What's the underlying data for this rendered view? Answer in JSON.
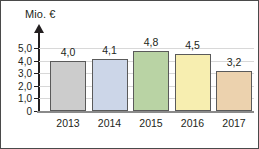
{
  "chart_data": {
    "type": "bar",
    "title": "",
    "subtitle": "",
    "xlabel": "",
    "ylabel": "Mio. €",
    "categories": [
      "2013",
      "2014",
      "2015",
      "2016",
      "2017"
    ],
    "values": [
      4.0,
      4.1,
      4.8,
      4.5,
      3.2
    ],
    "value_labels": [
      "4,0",
      "4,1",
      "4,8",
      "4,5",
      "3,2"
    ],
    "ylim": [
      0,
      5.6
    ],
    "ytick_values": [
      0,
      1.0,
      2.0,
      3.0,
      4.0,
      5.0
    ],
    "ytick_labels": [
      "0",
      "1,0",
      "2,0",
      "3,0",
      "4,0",
      "5,0"
    ],
    "grid": true,
    "grid_axis": "y",
    "legend": false,
    "legend_position": "none",
    "decimal_separator": ",",
    "bar_colors": [
      "#cccccc",
      "#ccd6e8",
      "#b9d3a4",
      "#f7eeb0",
      "#ecd2ae"
    ],
    "bar_border_color": "#5a5a5a",
    "axis_color": "#231f20",
    "gridline_color": "#d8d8d8",
    "baseline_color": "#8a8a8a",
    "frame_color": "#4a4a4a",
    "background_color": "#ffffff",
    "axis_arrow": "up"
  }
}
